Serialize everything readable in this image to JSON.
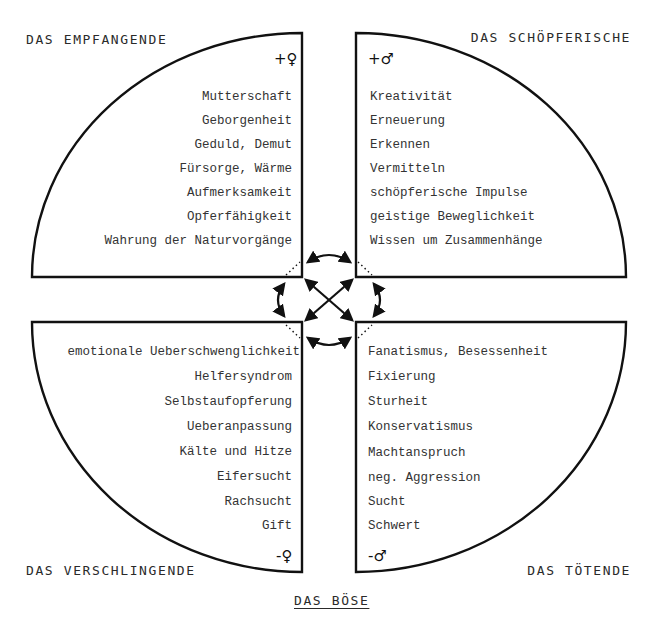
{
  "quadrants": {
    "top_left": {
      "title": "DAS EMPFANGENDE",
      "symbol": "+♀",
      "items": [
        "Mutterschaft",
        "Geborgenheit",
        "Geduld, Demut",
        "Fürsorge, Wärme",
        "Aufmerksamkeit",
        "Opferfähigkeit",
        "Wahrung der Naturvorgänge"
      ]
    },
    "top_right": {
      "title": "DAS SCHÖPFERISCHE",
      "symbol": "+♂",
      "items": [
        "Kreativität",
        "Erneuerung",
        "Erkennen",
        "Vermitteln",
        "schöpferische Impulse",
        "geistige Beweglichkeit",
        "Wissen um Zusammenhänge"
      ]
    },
    "bottom_left": {
      "title": "DAS VERSCHLINGENDE",
      "symbol": "-♀",
      "items": [
        "emotionale Ueberschwenglichkeit",
        "Helfersyndrom",
        "Selbstaufopferung",
        "Ueberanpassung",
        "Kälte und Hitze",
        "Eifersucht",
        "Rachsucht",
        "Gift"
      ]
    },
    "bottom_right": {
      "title": "DAS TÖTENDE",
      "symbol": "-♂",
      "items": [
        "Fanatismus, Besessenheit",
        "Fixierung",
        "Sturheit",
        "Konservatismus",
        "Machtanspruch",
        "neg. Aggression",
        "Sucht",
        "Schwert"
      ]
    }
  },
  "footer": {
    "title": "DAS BÖSE"
  },
  "colors": {
    "line": "#111111",
    "text": "#333333",
    "background": "#ffffff"
  }
}
